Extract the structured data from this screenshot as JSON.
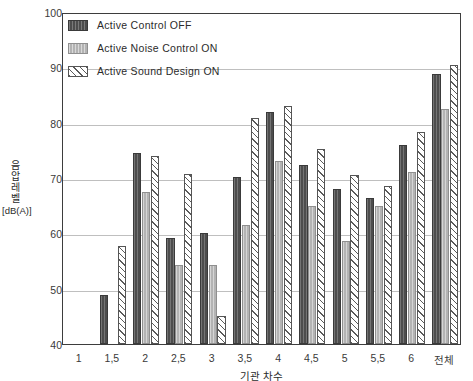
{
  "chart_data": {
    "type": "bar",
    "title": "",
    "xlabel": "기관 차수",
    "ylabel": "음압레벨 [dB(A)]",
    "ylabel_chars": [
      "음",
      "압",
      "레",
      "벨"
    ],
    "ylabel_unit": "[dB(A)]",
    "ylim": [
      40,
      100
    ],
    "yticks": [
      40,
      50,
      60,
      70,
      80,
      90,
      100
    ],
    "grid": true,
    "legend_position": "top-left-inside",
    "categories": [
      "1",
      "1,5",
      "2",
      "2,5",
      "3",
      "3,5",
      "4",
      "4,5",
      "5",
      "5,5",
      "6",
      "전체"
    ],
    "series": [
      {
        "name": "Active Control OFF",
        "pattern": "dark-solid",
        "color": "#4d4d4d",
        "values": [
          null,
          48.8,
          74.5,
          59.2,
          60.0,
          70.2,
          82.0,
          72.3,
          68.0,
          66.4,
          76.0,
          88.8
        ]
      },
      {
        "name": "Active Noise Control ON",
        "pattern": "light-gray",
        "color": "#b3b3b3",
        "values": [
          null,
          null,
          67.5,
          54.2,
          54.2,
          61.5,
          73.0,
          65.0,
          58.7,
          65.0,
          71.0,
          82.5
        ]
      },
      {
        "name": "Active Sound Design ON",
        "pattern": "diagonal-hatch",
        "color": "#ffffff",
        "values": [
          null,
          57.8,
          74.0,
          70.8,
          45.0,
          80.8,
          83.0,
          75.3,
          70.5,
          68.5,
          78.3,
          90.5
        ]
      }
    ]
  },
  "axis": {
    "y_tick_labels": [
      "100",
      "90",
      "80",
      "70",
      "60",
      "50",
      "40"
    ],
    "x_tick_labels": [
      "1",
      "1,5",
      "2",
      "2,5",
      "3",
      "3,5",
      "4",
      "4,5",
      "5",
      "5,5",
      "6",
      "전체"
    ],
    "x_axis_title": "기관 차수"
  },
  "legend": {
    "items": [
      {
        "label": "Active Control OFF",
        "swatch": "dark-solid-swatch"
      },
      {
        "label": "Active Noise Control ON",
        "swatch": "light-gray-swatch"
      },
      {
        "label": "Active Sound Design ON",
        "swatch": "diagonal-hatch-swatch"
      }
    ]
  },
  "colors": {
    "series_off": "#4d4d4d",
    "series_anc": "#b3b3b3",
    "series_asd": "#ffffff",
    "grid": "#bfbfbf",
    "frame": "#3d3d3d",
    "text": "#2b2b2b"
  }
}
